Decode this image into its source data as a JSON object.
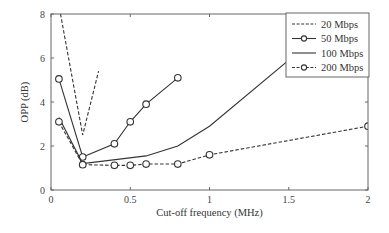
{
  "chart_data": {
    "type": "line",
    "title": "",
    "xlabel": "Cut-off frequency (MHz)",
    "ylabel": "OPP (dB)",
    "xlim": [
      0,
      2
    ],
    "ylim": [
      0,
      8
    ],
    "xticks": [
      "0",
      "0.5",
      "1",
      "1.5",
      "2"
    ],
    "xtick_values": [
      0,
      0.5,
      1,
      1.5,
      2
    ],
    "yticks": [
      "0",
      "2",
      "4",
      "6",
      "8"
    ],
    "ytick_values": [
      0,
      2,
      4,
      6,
      8
    ],
    "grid": false,
    "legend_position": "upper right",
    "series": [
      {
        "name": "20 Mbps",
        "style": "dashed",
        "marker": "none",
        "x": [
          0.06,
          0.2,
          0.3
        ],
        "y": [
          8.0,
          2.5,
          5.4
        ]
      },
      {
        "name": "50 Mbps",
        "style": "solid",
        "marker": "circle",
        "x": [
          0.05,
          0.2,
          0.4,
          0.5,
          0.6,
          0.8
        ],
        "y": [
          5.05,
          1.5,
          2.1,
          3.1,
          3.9,
          5.1
        ]
      },
      {
        "name": "100 Mbps",
        "style": "solid",
        "marker": "none",
        "x": [
          0.05,
          0.2,
          0.6,
          0.8,
          1.0,
          1.5,
          1.7
        ],
        "y": [
          3.3,
          1.2,
          1.55,
          2.0,
          2.9,
          5.9,
          7.5
        ]
      },
      {
        "name": "200 Mbps",
        "style": "dashed",
        "marker": "circle",
        "x": [
          0.05,
          0.2,
          0.4,
          0.5,
          0.6,
          0.8,
          1.0,
          2.0
        ],
        "y": [
          3.1,
          1.15,
          1.12,
          1.12,
          1.18,
          1.18,
          1.6,
          2.9
        ]
      }
    ]
  },
  "colors": {
    "line": "#333333",
    "axis": "#555555",
    "background": "#ffffff"
  }
}
